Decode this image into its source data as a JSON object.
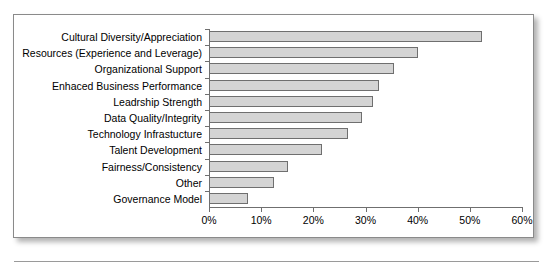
{
  "figure": {
    "frame_border_color": "#8a8a8a",
    "bar_fill_color": "#d4d4d4",
    "bar_border_color": "#6f6f6f",
    "axis_color": "#6f6f6f"
  },
  "chart_data": {
    "type": "bar",
    "orientation": "horizontal",
    "title": "",
    "subtitle": "",
    "xlabel": "",
    "ylabel": "",
    "xlim": [
      0,
      60
    ],
    "grid": false,
    "legend": null,
    "tick_labels": [
      "0%",
      "10%",
      "20%",
      "30%",
      "40%",
      "50%",
      "60%"
    ],
    "tick_values": [
      0,
      10,
      20,
      30,
      40,
      50,
      60
    ],
    "categories": [
      "Cultural Diversity/Appreciation",
      "Resources (Experience and Leverage)",
      "Organizational Support",
      "Enhaced Business Performance",
      "Leadrship Strength",
      "Data Quality/Integrity",
      "Technology Infrastucture",
      "Talent Development",
      "Fairness/Consistency",
      "Other",
      "Governance Model"
    ],
    "values": [
      52.3,
      40.0,
      35.4,
      32.6,
      31.4,
      29.3,
      26.6,
      21.6,
      15.1,
      12.4,
      7.5
    ],
    "value_unit": "%"
  }
}
